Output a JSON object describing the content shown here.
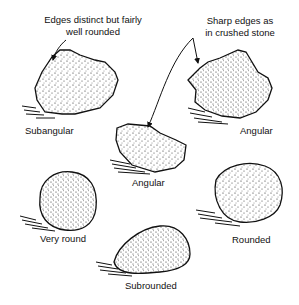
{
  "annotations": {
    "subangular_note_line1": "Edges distinct but fairly",
    "subangular_note_line2": "well rounded",
    "angular_note_line1": "Sharp edges as",
    "angular_note_line2": "in crushed stone"
  },
  "stones": [
    {
      "id": "subangular",
      "label": "Subangular"
    },
    {
      "id": "angular-top",
      "label": "Angular"
    },
    {
      "id": "angular-center",
      "label": "Angular"
    },
    {
      "id": "very-round",
      "label": "Very round"
    },
    {
      "id": "rounded",
      "label": "Rounded"
    },
    {
      "id": "subrounded",
      "label": "Subrounded"
    }
  ],
  "colors": {
    "ink": "#111111",
    "background": "#ffffff"
  }
}
